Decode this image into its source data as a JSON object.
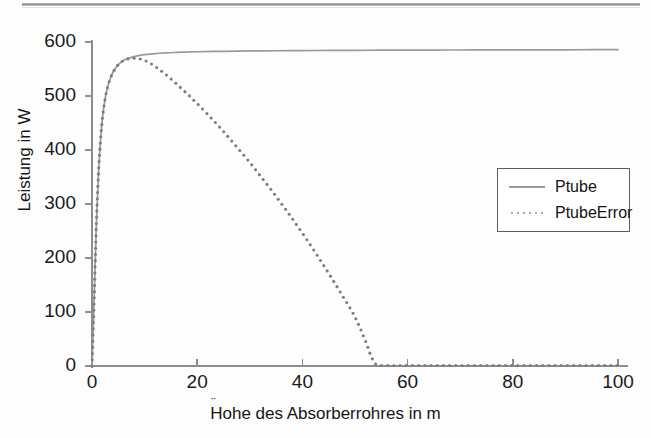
{
  "figure": {
    "background_color": "#fdfdfd",
    "top_rule_color": "#8a8a8a"
  },
  "chart_data": {
    "type": "line",
    "title": "",
    "xlabel": "Hohe des Absorberrohres in m",
    "xlabel_umlaut_char": "¨",
    "xlabel_prefix": "H",
    "xlabel_suffix": "ohe des Absorberrohres in m",
    "ylabel": "Leistung in W",
    "xlim": [
      0,
      100
    ],
    "ylim": [
      0,
      600
    ],
    "xticks": [
      0,
      20,
      40,
      60,
      80,
      100
    ],
    "xtick_labels": [
      "0",
      "20",
      "40",
      "60",
      "80",
      "100"
    ],
    "yticks": [
      0,
      100,
      200,
      300,
      400,
      500,
      600
    ],
    "ytick_labels": [
      "0",
      "100",
      "200",
      "300",
      "400",
      "500",
      "600"
    ],
    "grid": false,
    "legend_position": "center-right",
    "series": [
      {
        "name": "Ptube",
        "style": "solid",
        "color": "#9a9a9a",
        "x": [
          0,
          0.4,
          0.8,
          1.2,
          1.6,
          2,
          2.5,
          3,
          3.5,
          4,
          4.5,
          5,
          6,
          7,
          8,
          9,
          10,
          12,
          14,
          16,
          18,
          20,
          25,
          30,
          35,
          40,
          45,
          50,
          55,
          60,
          65,
          70,
          75,
          80,
          85,
          90,
          95,
          100
        ],
        "y": [
          0,
          120,
          255,
          350,
          415,
          460,
          495,
          518,
          533,
          544,
          552,
          558,
          566,
          570,
          573,
          575,
          576.5,
          578.5,
          579.8,
          580.7,
          581.4,
          581.9,
          582.8,
          583.4,
          583.8,
          584.1,
          584.4,
          584.6,
          584.8,
          585.0,
          585.1,
          585.2,
          585.3,
          585.4,
          585.5,
          585.6,
          585.7,
          585.8
        ]
      },
      {
        "name": "PtubeError",
        "style": "dotted",
        "color": "#7d7d7d",
        "x": [
          0,
          0.4,
          0.8,
          1.2,
          1.6,
          2,
          2.5,
          3,
          3.5,
          4,
          4.5,
          5,
          6,
          7,
          8,
          9,
          10,
          11,
          12,
          14,
          16,
          18,
          20,
          22,
          24,
          26,
          28,
          30,
          32,
          34,
          36,
          38,
          40,
          42,
          44,
          46,
          48,
          50,
          52,
          53,
          54,
          56,
          60,
          65,
          70,
          75,
          80,
          85,
          90,
          95,
          100
        ],
        "y": [
          0,
          120,
          255,
          350,
          415,
          460,
          495,
          518,
          533,
          544,
          552,
          558,
          566,
          569,
          570,
          569,
          566,
          561,
          555,
          540,
          523,
          505,
          486,
          466,
          445,
          423,
          400,
          377,
          352,
          327,
          301,
          274,
          246,
          217,
          187,
          156,
          124,
          91,
          46,
          20,
          3,
          1,
          1,
          1,
          1,
          1,
          1,
          1,
          1,
          1,
          1
        ]
      }
    ]
  },
  "legend": {
    "entries": [
      {
        "label": "Ptube",
        "sample": "solid-line-sample"
      },
      {
        "label": "PtubeError",
        "sample": "dotted-line-sample"
      }
    ]
  }
}
